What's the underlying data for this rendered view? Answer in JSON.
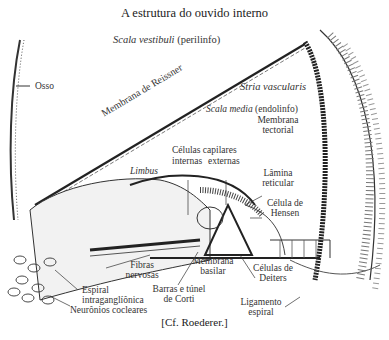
{
  "title": "A estrutura do ouvido interno",
  "credit": "[Cf. Roederer.]",
  "labels": {
    "scala_vestibuli": "Scala vestibuli",
    "scala_vestibuli_note": "(perilinfo)",
    "osso": "Osso",
    "membrana_reissner": "Membrana de Reissner",
    "stria_vascularis": "Stria vascularis",
    "scala_media": "Scala media",
    "scala_media_note": "(endolinfo)",
    "membrana_tectorial_1": "Membrana",
    "membrana_tectorial_2": "tectorial",
    "celulas_capilares": "Células capilares",
    "internas": "internas",
    "externas": "externas",
    "limbus": "Limbus",
    "lamina_reticular_1": "Lâmina",
    "lamina_reticular_2": "reticular",
    "celula_hensen_1": "Célula de",
    "celula_hensen_2": "Hensen",
    "fibras_nervosas_1": "Fibras",
    "fibras_nervosas_2": "nervosas",
    "membrana_basilar_1": "Membrana",
    "membrana_basilar_2": "basilar",
    "celulas_deiters_1": "Células de",
    "celulas_deiters_2": "Deiters",
    "espiral_1": "Espiral",
    "espiral_2": "intraganglíônica",
    "neuronios": "Neurônios cocleares",
    "barras_1": "Barras e túnel",
    "barras_2": "de Corti",
    "ligamento_1": "Ligamento",
    "ligamento_2": "espiral"
  }
}
